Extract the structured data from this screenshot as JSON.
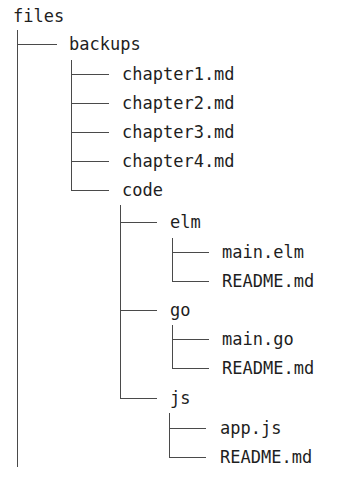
{
  "tree": {
    "root": "files",
    "backups": "backups",
    "chapter1": "chapter1.md",
    "chapter2": "chapter2.md",
    "chapter3": "chapter3.md",
    "chapter4": "chapter4.md",
    "code": "code",
    "elm": "elm",
    "elm_main": "main.elm",
    "elm_readme": "README.md",
    "go": "go",
    "go_main": "main.go",
    "go_readme": "README.md",
    "js": "js",
    "js_app": "app.js",
    "js_readme": "README.md"
  },
  "colors": {
    "text": "#1e1e1e",
    "lines": "#4a4a4a",
    "background": "#ffffff"
  }
}
